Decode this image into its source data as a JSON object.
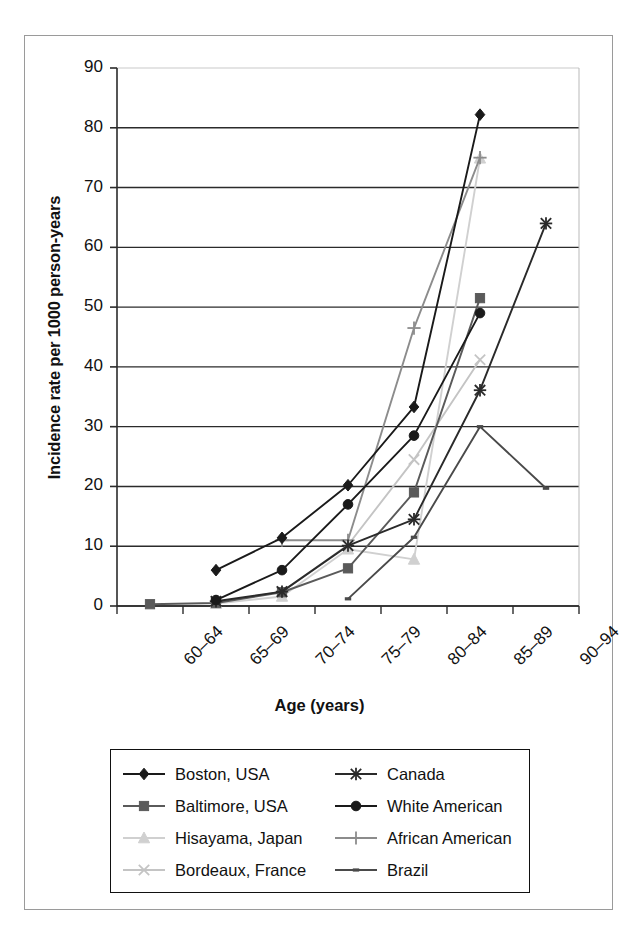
{
  "chart_data": {
    "type": "line",
    "title": "",
    "xlabel": "Age (years)",
    "ylabel": "Incidence rate per 1000 person-years",
    "categories": [
      "60–64",
      "65–69",
      "70–74",
      "75–79",
      "80–84",
      "85–89",
      "90–94"
    ],
    "ylim": [
      0,
      90
    ],
    "yticks": [
      0,
      10,
      20,
      30,
      40,
      50,
      60,
      70,
      80,
      90
    ],
    "grid": "horizontal",
    "legend_position": "below-plot",
    "series": [
      {
        "name": "Boston, USA",
        "marker": "diamond",
        "color": "#1a1a1a",
        "x": [
          "65–69",
          "70–74",
          "75–79",
          "80–84",
          "85–89"
        ],
        "values": [
          6.0,
          11.4,
          20.2,
          33.3,
          82.2
        ]
      },
      {
        "name": "Baltimore, USA",
        "marker": "square",
        "color": "#5a5a5a",
        "x": [
          "60–64",
          "65–69",
          "70–74",
          "75–79",
          "80–84",
          "85–89"
        ],
        "values": [
          0.3,
          0.5,
          2.3,
          6.3,
          19.0,
          51.5
        ]
      },
      {
        "name": "Hisayama, Japan",
        "marker": "triangle",
        "color": "#d0d0d0",
        "x": [
          "65–69",
          "70–74",
          "75–79",
          "80–84",
          "85–89"
        ],
        "values": [
          0.4,
          1.6,
          9.5,
          7.8,
          74.9
        ]
      },
      {
        "name": "Bordeaux, France",
        "marker": "x",
        "color": "#c4c4c4",
        "x": [
          "65–69",
          "70–74",
          "75–79",
          "80–84",
          "85–89"
        ],
        "values": [
          0.6,
          2.4,
          10.2,
          24.5,
          41.2
        ]
      },
      {
        "name": "Canada",
        "marker": "asterisk",
        "color": "#2a2a2a",
        "x": [
          "65–69",
          "70–74",
          "75–79",
          "80–84",
          "85–89",
          "90–94"
        ],
        "values": [
          0.8,
          2.4,
          10.1,
          14.5,
          36.1,
          64.0
        ]
      },
      {
        "name": "White American",
        "marker": "circle",
        "color": "#1a1a1a",
        "x": [
          "65–69",
          "70–74",
          "75–79",
          "80–84",
          "85–89"
        ],
        "values": [
          1.0,
          6.0,
          17.0,
          28.5,
          49.0
        ]
      },
      {
        "name": "African American",
        "marker": "plus",
        "color": "#8c8c8c",
        "x": [
          "70–74",
          "75–79",
          "80–84",
          "85–89"
        ],
        "values": [
          11.0,
          11.0,
          46.5,
          75.0
        ]
      },
      {
        "name": "Brazil",
        "marker": "dash",
        "color": "#4a4a4a",
        "x": [
          "75–79",
          "80–84",
          "85–89",
          "90–94"
        ],
        "values": [
          1.2,
          11.5,
          30.0,
          19.7
        ]
      }
    ]
  }
}
